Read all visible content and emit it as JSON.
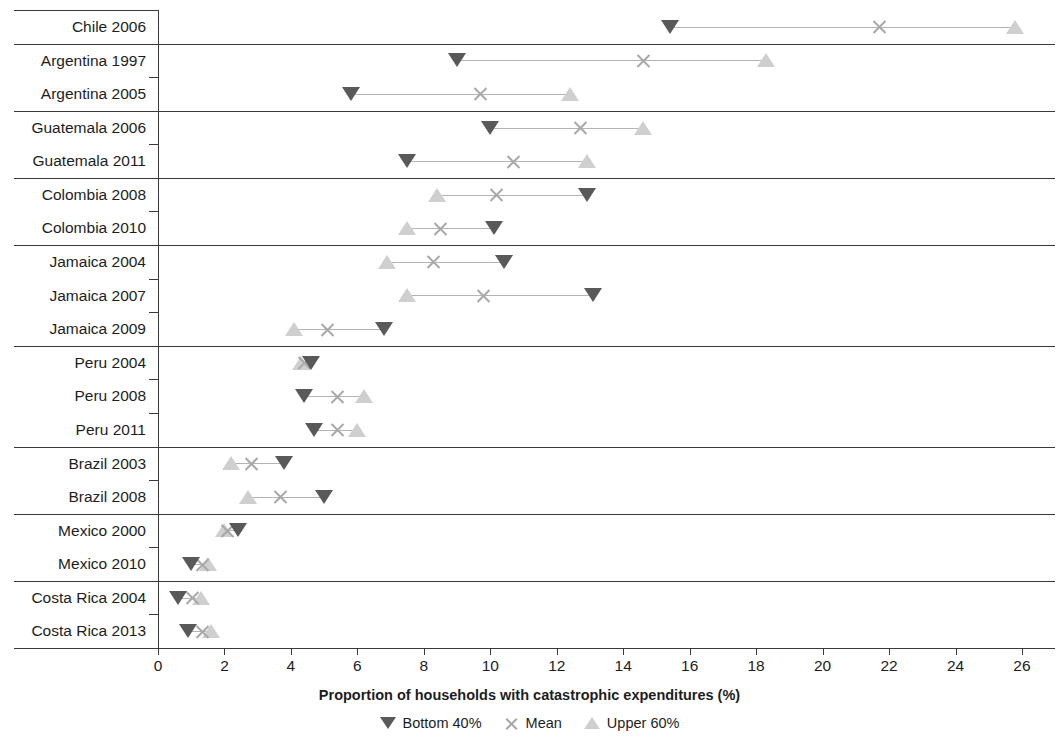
{
  "chart_data": {
    "type": "scatter",
    "title": "",
    "xlabel": "Proportion of households with catastrophic expenditures (%)",
    "ylabel": "",
    "xlim": [
      0,
      26.7
    ],
    "grid": false,
    "legend_position": "bottom",
    "axis": {
      "ticks": [
        0,
        2,
        4,
        6,
        8,
        10,
        12,
        14,
        16,
        18,
        20,
        22,
        24,
        26
      ],
      "tick_labels": [
        "0",
        "2",
        "4",
        "6",
        "8",
        "10",
        "12",
        "14",
        "16",
        "18",
        "20",
        "22",
        "24",
        "26"
      ]
    },
    "series": [
      {
        "name": "Bottom 40%",
        "key": "bottom",
        "marker": "down-triangle",
        "color": "#595959"
      },
      {
        "name": "Mean",
        "key": "mean",
        "marker": "x",
        "color": "#a8a8a8"
      },
      {
        "name": "Upper 60%",
        "key": "upper",
        "marker": "up-triangle",
        "color": "#cfcfcf"
      }
    ],
    "categories": [
      "Chile 2006",
      "Argentina 1997",
      "Argentina 2005",
      "Guatemala 2006",
      "Guatemala 2011",
      "Colombia 2008",
      "Colombia 2010",
      "Jamaica 2004",
      "Jamaica 2007",
      "Jamaica 2009",
      "Peru 2004",
      "Peru 2008",
      "Peru 2011",
      "Brazil 2003",
      "Brazil 2008",
      "Mexico 2000",
      "Mexico 2010",
      "Costa Rica 2004",
      "Costa Rica 2013"
    ],
    "rows": [
      {
        "label": "Chile 2006",
        "bottom": 15.4,
        "mean": 21.7,
        "upper": 25.8,
        "group_start": true
      },
      {
        "label": "Argentina 1997",
        "bottom": 9.0,
        "mean": 14.6,
        "upper": 18.3,
        "group_start": true
      },
      {
        "label": "Argentina 2005",
        "bottom": 5.8,
        "mean": 9.7,
        "upper": 12.4,
        "group_start": false
      },
      {
        "label": "Guatemala 2006",
        "bottom": 10.0,
        "mean": 12.7,
        "upper": 14.6,
        "group_start": true
      },
      {
        "label": "Guatemala 2011",
        "bottom": 7.5,
        "mean": 10.7,
        "upper": 12.9,
        "group_start": false
      },
      {
        "label": "Colombia 2008",
        "bottom": 12.9,
        "mean": 10.2,
        "upper": 8.4,
        "group_start": true
      },
      {
        "label": "Colombia 2010",
        "bottom": 10.1,
        "mean": 8.5,
        "upper": 7.5,
        "group_start": false
      },
      {
        "label": "Jamaica 2004",
        "bottom": 10.4,
        "mean": 8.3,
        "upper": 6.9,
        "group_start": true
      },
      {
        "label": "Jamaica 2007",
        "bottom": 13.1,
        "mean": 9.8,
        "upper": 7.5,
        "group_start": false
      },
      {
        "label": "Jamaica 2009",
        "bottom": 6.8,
        "mean": 5.1,
        "upper": 4.1,
        "group_start": false
      },
      {
        "label": "Peru 2004",
        "bottom": 4.6,
        "mean": 4.4,
        "upper": 4.3,
        "group_start": true
      },
      {
        "label": "Peru 2008",
        "bottom": 4.4,
        "mean": 5.4,
        "upper": 6.2,
        "group_start": false
      },
      {
        "label": "Peru 2011",
        "bottom": 4.7,
        "mean": 5.4,
        "upper": 6.0,
        "group_start": false
      },
      {
        "label": "Brazil 2003",
        "bottom": 3.8,
        "mean": 2.8,
        "upper": 2.2,
        "group_start": true
      },
      {
        "label": "Brazil 2008",
        "bottom": 5.0,
        "mean": 3.7,
        "upper": 2.7,
        "group_start": false
      },
      {
        "label": "Mexico 2000",
        "bottom": 2.4,
        "mean": 2.1,
        "upper": 2.0,
        "group_start": true
      },
      {
        "label": "Mexico 2010",
        "bottom": 1.0,
        "mean": 1.35,
        "upper": 1.5,
        "group_start": false
      },
      {
        "label": "Costa Rica 2004",
        "bottom": 0.6,
        "mean": 1.05,
        "upper": 1.3,
        "group_start": true
      },
      {
        "label": "Costa Rica 2013",
        "bottom": 0.9,
        "mean": 1.35,
        "upper": 1.6,
        "group_start": false
      }
    ]
  },
  "legend": {
    "items": [
      {
        "label": "Bottom 40%"
      },
      {
        "label": "Mean"
      },
      {
        "label": "Upper 60%"
      }
    ]
  }
}
